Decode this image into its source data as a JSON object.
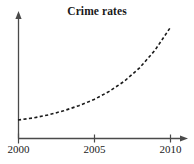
{
  "figure": {
    "width": 194,
    "height": 164,
    "background_color": "#ffffff",
    "axis_color": "#4a4a4a",
    "curve_color": "#1a1a1a",
    "text_color": "#1a1a1a"
  },
  "chart_data": {
    "type": "line",
    "title": "Crime rates",
    "xlabel": "",
    "ylabel": "",
    "x": [
      2000,
      2001,
      2002,
      2003,
      2004,
      2005,
      2006,
      2007,
      2008,
      2009,
      2010
    ],
    "values": [
      10,
      12,
      15,
      19,
      24,
      30,
      38,
      48,
      61,
      78,
      100
    ],
    "series": [
      {
        "name": "Crime rates",
        "values": [
          10,
          12,
          15,
          19,
          24,
          30,
          38,
          48,
          61,
          78,
          100
        ],
        "style": "dashed",
        "color": "#1a1a1a"
      }
    ],
    "xticks": [
      2000,
      2005,
      2010
    ],
    "xtick_labels": [
      "2000",
      "2005",
      "2010"
    ],
    "yticks": [],
    "ytick_labels": [],
    "xlim": [
      2000,
      2010
    ],
    "ylim": [
      0,
      115
    ],
    "grid": false,
    "legend": false,
    "legend_position": "none",
    "annotations": [],
    "axis_arrows": {
      "x_axis_arrow": "arrow-right",
      "y_axis_arrow": "arrow-up"
    }
  },
  "axes": {
    "x_ticks": [
      {
        "label": "2000",
        "x": 18
      },
      {
        "label": "2005",
        "x": 94
      },
      {
        "label": "2010",
        "x": 170
      }
    ]
  },
  "icons": {
    "x_axis_arrow": "arrow-right-icon",
    "y_axis_arrow": "arrow-up-icon"
  }
}
